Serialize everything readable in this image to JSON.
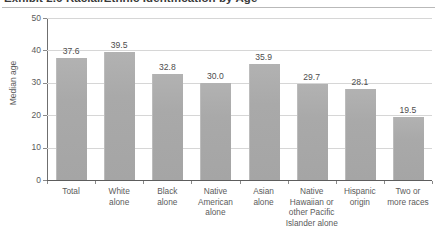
{
  "title": "Exhibit 2.6  Racial/Ethnic Identification by Age",
  "chart_data": {
    "type": "bar",
    "title": "Exhibit 2.6  Racial/Ethnic Identification by Age",
    "xlabel": "",
    "ylabel": "Median age",
    "ylim": [
      0,
      50
    ],
    "yticks": [
      "0",
      "10",
      "20",
      "30",
      "40",
      "50"
    ],
    "ytick_values": [
      0,
      10,
      20,
      30,
      40,
      50
    ],
    "grid": true,
    "legend": "none",
    "categories": [
      "Total",
      "White alone",
      "Black alone",
      "Native American alone",
      "Asian alone",
      "Native Hawaiian or other Pacific Islander alone",
      "Hispanic origin",
      "Two or more races"
    ],
    "category_lines": [
      [
        "Total"
      ],
      [
        "White",
        "alone"
      ],
      [
        "Black",
        "alone"
      ],
      [
        "Native",
        "American",
        "alone"
      ],
      [
        "Asian",
        "alone"
      ],
      [
        "Native",
        "Hawaiian or",
        "other Pacific",
        "Islander alone"
      ],
      [
        "Hispanic",
        "origin"
      ],
      [
        "Two or",
        "more races"
      ]
    ],
    "values": [
      37.6,
      39.5,
      32.8,
      30.0,
      35.9,
      29.7,
      28.1,
      19.5
    ],
    "value_labels": [
      "37.6",
      "39.5",
      "32.8",
      "30.0",
      "35.9",
      "29.7",
      "28.1",
      "19.5"
    ]
  },
  "colors": {
    "bar": "#a8a8a8",
    "gridline": "#d6d6d6",
    "axis": "#5d5d5d",
    "text": "#5b5b5b",
    "title_text": "#3a3a3a"
  }
}
